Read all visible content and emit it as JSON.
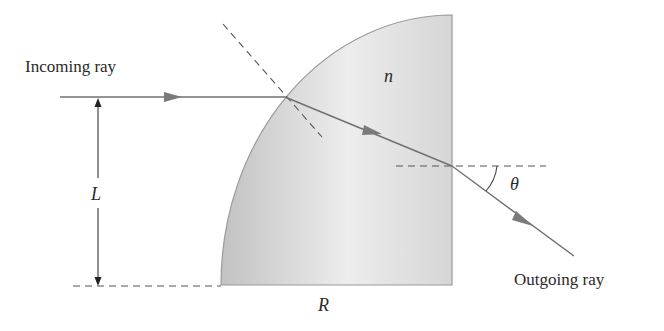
{
  "diagram": {
    "labels": {
      "incoming": "Incoming ray",
      "outgoing": "Outgoing ray",
      "index": "n",
      "height": "L",
      "radius": "R",
      "angle": "θ"
    },
    "colors": {
      "ray": "#707070",
      "arrowhead": "#7a7a7a",
      "fill_dark": "#c4c4c4",
      "fill_light": "#f4f4f4",
      "outline": "#9a9a9a",
      "dash": "#555555",
      "text": "#2a2a2a"
    },
    "geometry": {
      "center": [
        452,
        285
      ],
      "radius_x": 231,
      "radius_y": 270,
      "entry_point": [
        285,
        97
      ],
      "exit_point": [
        452,
        166
      ],
      "outgoing_end": [
        574,
        256
      ]
    }
  }
}
